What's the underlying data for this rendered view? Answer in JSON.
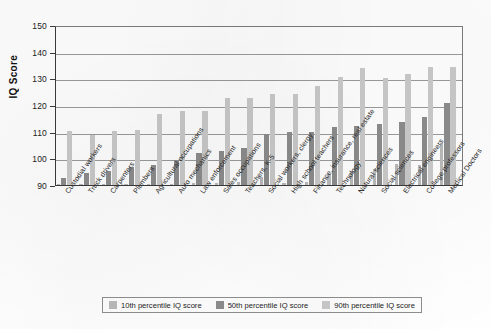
{
  "chart_data": {
    "type": "bar",
    "title": "",
    "xlabel": "",
    "ylabel": "IQ Score",
    "ylim": [
      90,
      150
    ],
    "ytick_values": [
      150,
      140,
      130,
      120,
      110,
      100,
      90
    ],
    "ytick_labels": [
      "150",
      "140",
      "130",
      "120",
      "110",
      "100",
      "90"
    ],
    "grid": true,
    "legend_position": "bottom-center",
    "categories": [
      "Custodial workers",
      "Truck drivers",
      "Carpenters",
      "Plumbers",
      "Agricultural occupations",
      "Auto mechanics",
      "Law enforcement",
      "Sales occupations",
      "Teachers, K-5",
      "Social workers, clergy",
      "High school teachers",
      "Finance, insurance, real estate",
      "Technology",
      "Natural sciences",
      "Social sciences",
      "Electrical engineers",
      "College professors",
      "Medical Doctors"
    ],
    "series": [
      {
        "name": "10th percentile IQ score",
        "color": "#b9b9b9",
        "values": [
          90.5,
          90.3,
          90.3,
          90.3,
          90.4,
          90.4,
          90.6,
          90.8,
          91.0,
          93.0,
          90.6,
          91.0,
          94.0,
          95.5,
          96.0,
          98.0,
          97.5,
          106.0
        ]
      },
      {
        "name": "50th percentile IQ score",
        "color": "#8c8c8c",
        "values": [
          92.5,
          94.5,
          95.5,
          97.0,
          97.5,
          99.5,
          102.0,
          103.0,
          104.0,
          109.5,
          110.0,
          110.0,
          112.0,
          112.5,
          113.0,
          114.0,
          116.0,
          121.0
        ]
      },
      {
        "name": "90th percentile IQ score",
        "color": "#c9c9c9",
        "values": [
          110.5,
          109.0,
          110.5,
          111.0,
          117.0,
          118.0,
          118.0,
          123.0,
          123.0,
          124.5,
          124.5,
          127.5,
          131.0,
          134.5,
          130.5,
          132.0,
          135.0,
          135.0
        ]
      }
    ]
  },
  "legend": {
    "items": [
      {
        "label": "10th percentile IQ score",
        "color": "#b9b9b9"
      },
      {
        "label": "50th percentile IQ score",
        "color": "#8c8c8c"
      },
      {
        "label": "90th percentile IQ score",
        "color": "#c9c9c9"
      }
    ]
  }
}
